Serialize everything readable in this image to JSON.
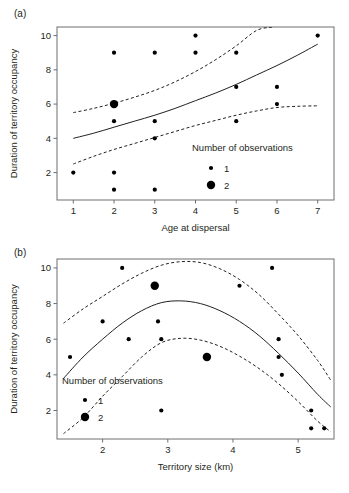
{
  "figure": {
    "background": "#ffffff",
    "ink": "#231f20",
    "frame_color": "#6d6e70"
  },
  "panels": [
    {
      "id": "a",
      "label": "(a)",
      "legend_title": "Number of observations",
      "legend_items": [
        {
          "label": "1",
          "size": 1
        },
        {
          "label": "2",
          "size": 2
        }
      ]
    },
    {
      "id": "b",
      "label": "(b)",
      "legend_title": "Number of observations",
      "legend_items": [
        {
          "label": "1",
          "size": 1
        },
        {
          "label": "2",
          "size": 2
        }
      ]
    }
  ],
  "chart_data": [
    {
      "type": "scatter",
      "panel": "(a)",
      "title": "",
      "xlabel": "Age at dispersal",
      "ylabel": "Duration of territory occupancy",
      "xlim": [
        0.6,
        7.4
      ],
      "ylim": [
        0.4,
        10.5
      ],
      "xticks": [
        1,
        2,
        3,
        4,
        5,
        6,
        7
      ],
      "xticklabels": [
        "1",
        "2",
        "3",
        "4",
        "5",
        "6",
        "7"
      ],
      "yticks": [
        2,
        4,
        6,
        8,
        10
      ],
      "yticklabels": [
        "2",
        "4",
        "6",
        "8",
        "10"
      ],
      "grid": false,
      "legend_position": "bottom-right",
      "legend_title": "Number of observations",
      "size_legend": [
        {
          "label": "1",
          "count": 1
        },
        {
          "label": "2",
          "count": 2
        }
      ],
      "points": [
        {
          "x": 1,
          "y": 2,
          "n": 1
        },
        {
          "x": 2,
          "y": 9,
          "n": 1
        },
        {
          "x": 2,
          "y": 6,
          "n": 2
        },
        {
          "x": 2,
          "y": 5,
          "n": 1
        },
        {
          "x": 2,
          "y": 2,
          "n": 1
        },
        {
          "x": 2,
          "y": 1,
          "n": 1
        },
        {
          "x": 3,
          "y": 9,
          "n": 1
        },
        {
          "x": 3,
          "y": 5,
          "n": 1
        },
        {
          "x": 3,
          "y": 4,
          "n": 1
        },
        {
          "x": 3,
          "y": 1,
          "n": 1
        },
        {
          "x": 4,
          "y": 10,
          "n": 1
        },
        {
          "x": 4,
          "y": 9,
          "n": 1
        },
        {
          "x": 5,
          "y": 9,
          "n": 1
        },
        {
          "x": 5,
          "y": 7,
          "n": 1
        },
        {
          "x": 5,
          "y": 5,
          "n": 1
        },
        {
          "x": 6,
          "y": 7,
          "n": 1
        },
        {
          "x": 6,
          "y": 6,
          "n": 1
        },
        {
          "x": 7,
          "y": 10,
          "n": 1
        }
      ],
      "series": [
        {
          "name": "fit",
          "style": "solid",
          "x": [
            1.0,
            1.5,
            2.0,
            2.5,
            3.0,
            3.5,
            4.0,
            4.5,
            5.0,
            5.5,
            6.0,
            6.5,
            7.0
          ],
          "y": [
            4.0,
            4.3,
            4.65,
            5.0,
            5.35,
            5.75,
            6.2,
            6.65,
            7.15,
            7.7,
            8.25,
            8.85,
            9.5
          ]
        },
        {
          "name": "upper_confidence",
          "style": "dashed",
          "x": [
            1.0,
            1.5,
            2.0,
            2.5,
            3.0,
            3.5,
            4.0,
            4.5,
            5.0,
            5.5,
            5.9
          ],
          "y": [
            5.5,
            5.75,
            6.05,
            6.4,
            6.8,
            7.3,
            7.9,
            8.6,
            9.4,
            10.3,
            10.5
          ]
        },
        {
          "name": "lower_confidence",
          "style": "dashed",
          "x": [
            1.0,
            1.5,
            2.0,
            2.5,
            3.0,
            3.5,
            4.0,
            4.5,
            5.0,
            5.5,
            6.0,
            6.5,
            7.0
          ],
          "y": [
            2.5,
            2.95,
            3.35,
            3.7,
            4.05,
            4.4,
            4.75,
            5.05,
            5.35,
            5.6,
            5.8,
            5.87,
            5.9
          ]
        }
      ]
    },
    {
      "type": "scatter",
      "panel": "(b)",
      "title": "",
      "xlabel": "Territory size (km)",
      "ylabel": "Duration of territory occupancy",
      "xlim": [
        1.3,
        5.55
      ],
      "ylim": [
        0.4,
        10.5
      ],
      "xticks": [
        2,
        3,
        4,
        5
      ],
      "xticklabels": [
        "2",
        "3",
        "4",
        "5"
      ],
      "yticks": [
        2,
        4,
        6,
        8,
        10
      ],
      "yticklabels": [
        "2",
        "4",
        "6",
        "8",
        "10"
      ],
      "grid": false,
      "legend_position": "bottom-left",
      "legend_title": "Number of observations",
      "size_legend": [
        {
          "label": "1",
          "count": 1
        },
        {
          "label": "2",
          "count": 2
        }
      ],
      "points": [
        {
          "x": 1.5,
          "y": 5,
          "n": 1
        },
        {
          "x": 2.0,
          "y": 7,
          "n": 1
        },
        {
          "x": 2.3,
          "y": 10,
          "n": 1
        },
        {
          "x": 2.4,
          "y": 6,
          "n": 1
        },
        {
          "x": 2.8,
          "y": 9,
          "n": 2
        },
        {
          "x": 2.85,
          "y": 7,
          "n": 1
        },
        {
          "x": 2.9,
          "y": 6,
          "n": 1
        },
        {
          "x": 2.9,
          "y": 2,
          "n": 1
        },
        {
          "x": 3.6,
          "y": 5,
          "n": 2
        },
        {
          "x": 4.1,
          "y": 9,
          "n": 1
        },
        {
          "x": 4.6,
          "y": 10,
          "n": 1
        },
        {
          "x": 4.7,
          "y": 6,
          "n": 1
        },
        {
          "x": 4.7,
          "y": 5,
          "n": 1
        },
        {
          "x": 4.75,
          "y": 4,
          "n": 1
        },
        {
          "x": 5.2,
          "y": 2,
          "n": 1
        },
        {
          "x": 5.2,
          "y": 1,
          "n": 1
        },
        {
          "x": 5.4,
          "y": 1,
          "n": 1
        }
      ],
      "series": [
        {
          "name": "fit",
          "style": "solid",
          "x": [
            1.4,
            1.7,
            2.0,
            2.3,
            2.6,
            2.9,
            3.2,
            3.5,
            3.8,
            4.1,
            4.4,
            4.7,
            5.0,
            5.3,
            5.5
          ],
          "y": [
            3.8,
            5.0,
            6.0,
            6.9,
            7.6,
            8.05,
            8.15,
            8.0,
            7.6,
            7.0,
            6.2,
            5.2,
            4.1,
            2.9,
            2.2
          ]
        },
        {
          "name": "upper_confidence",
          "style": "dashed",
          "x": [
            1.4,
            1.7,
            2.0,
            2.3,
            2.6,
            2.9,
            3.2,
            3.5,
            3.8,
            4.1,
            4.4,
            4.7,
            5.0,
            5.3,
            5.5
          ],
          "y": [
            6.9,
            7.7,
            8.4,
            9.1,
            9.7,
            10.15,
            10.35,
            10.3,
            9.95,
            9.35,
            8.5,
            7.4,
            6.2,
            4.8,
            3.7
          ]
        },
        {
          "name": "lower_confidence",
          "style": "dashed",
          "x": [
            1.4,
            1.7,
            2.0,
            2.3,
            2.6,
            2.9,
            3.2,
            3.5,
            3.8,
            4.1,
            4.4,
            4.7,
            5.0,
            5.3,
            5.5
          ],
          "y": [
            0.7,
            1.6,
            2.8,
            3.9,
            5.0,
            5.8,
            6.05,
            5.95,
            5.6,
            5.05,
            4.35,
            3.5,
            2.5,
            1.4,
            0.8
          ]
        }
      ]
    }
  ]
}
